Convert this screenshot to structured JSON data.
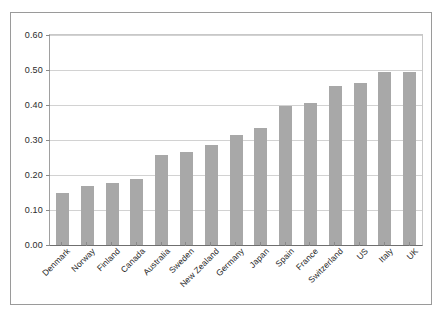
{
  "chart_data": {
    "type": "bar",
    "title": "",
    "subtitle": "",
    "xlabel": "",
    "ylabel": "",
    "ylim": [
      0,
      0.6
    ],
    "ytick_labels": [
      "0.00",
      "0.10",
      "0.20",
      "0.30",
      "0.40",
      "0.50",
      "0.60"
    ],
    "ytick_values": [
      0,
      0.1,
      0.2,
      0.3,
      0.4,
      0.5,
      0.6
    ],
    "grid": "horizontal",
    "legend": "none",
    "bar_color": "#a8a8a8",
    "categories": [
      "Denmark",
      "Norway",
      "Finland",
      "Canada",
      "Australia",
      "Sweden",
      "New Zealand",
      "Germany",
      "Japan",
      "Spain",
      "France",
      "Switzerland",
      "US",
      "Italy",
      "UK"
    ],
    "values": [
      0.149,
      0.168,
      0.178,
      0.188,
      0.257,
      0.266,
      0.287,
      0.315,
      0.335,
      0.396,
      0.405,
      0.455,
      0.463,
      0.495,
      0.495
    ]
  }
}
